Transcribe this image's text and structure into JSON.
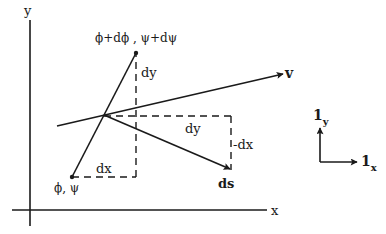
{
  "diagram": {
    "type": "vector-geometry",
    "axes": {
      "x_label": "x",
      "y_label": "y"
    },
    "points": {
      "start": {
        "label": "ϕ, ψ"
      },
      "end": {
        "label": "ϕ+dϕ , ψ+dψ"
      }
    },
    "segment_labels": {
      "dx": "dx",
      "dy_vertical": "dy",
      "dy_rotated": "dy",
      "neg_dx": "-dx"
    },
    "vectors": {
      "v": "v",
      "ds": "ds"
    },
    "unit_vectors": {
      "x": {
        "base": "1",
        "sub": "x"
      },
      "y": {
        "base": "1",
        "sub": "y"
      }
    },
    "colors": {
      "ink": "#1a1a1a",
      "background": "#ffffff"
    }
  }
}
